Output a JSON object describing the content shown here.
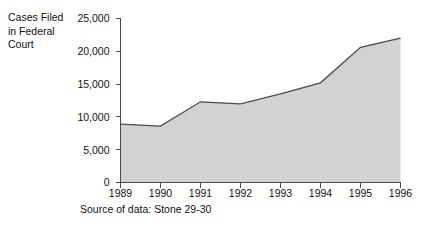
{
  "figure": {
    "y_axis_caption": "Cases Filed\nin Federal\nCourt",
    "source_note": "Source of data: Stone 29-30"
  },
  "style": {
    "area_fill": "#d2d2d2",
    "line_stroke": "#4b4b4b",
    "axis_stroke": "#4a4a4a",
    "background": "#ffffff",
    "text_color": "#111111"
  },
  "chart_data": {
    "type": "area",
    "title": "",
    "subtitle": "",
    "xlabel": "",
    "ylabel": "Cases Filed in Federal Court",
    "categories": [
      "1989",
      "1990",
      "1991",
      "1992",
      "1993",
      "1994",
      "1995",
      "1996"
    ],
    "x": [
      1989,
      1990,
      1991,
      1992,
      1993,
      1994,
      1995,
      1996
    ],
    "values": [
      8900,
      8600,
      12300,
      12000,
      13500,
      15200,
      20600,
      22000
    ],
    "series": [
      {
        "name": "Cases Filed in Federal Court",
        "values": [
          8900,
          8600,
          12300,
          12000,
          13500,
          15200,
          20600,
          22000
        ]
      }
    ],
    "ylim": [
      0,
      25000
    ],
    "xlim": [
      1989,
      1996
    ],
    "yticks": [
      0,
      5000,
      10000,
      15000,
      20000,
      25000
    ],
    "ytick_labels": [
      "0",
      "5,000",
      "10,000",
      "15,000",
      "20,000",
      "25,000"
    ],
    "xtick_labels": [
      "1989",
      "1990",
      "1991",
      "1992",
      "1993",
      "1994",
      "1995",
      "1996"
    ],
    "grid": false,
    "legend": "none",
    "annotations": [
      "Source of data: Stone 29-30"
    ]
  }
}
